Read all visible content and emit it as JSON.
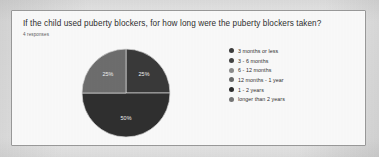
{
  "card": {
    "title": "If the child used puberty blockers, for how long were the puberty blockers taken?",
    "subtitle": "4 responses"
  },
  "chart_data": {
    "type": "pie",
    "title": "If the child used puberty blockers, for how long were the puberty blockers taken?",
    "subtitle": "4 responses",
    "legend_position": "right",
    "categories": [
      "3 months or less",
      "3 - 6 months",
      "6 - 12 months",
      "12 months - 1 year",
      "1 - 2 years",
      "longer than 2 years"
    ],
    "values": [
      25,
      25,
      50,
      0,
      0,
      0
    ],
    "value_unit": "%",
    "slices": [
      {
        "label": "3 months or less",
        "percent": "25%",
        "value": 25,
        "color": "#3a3a3a",
        "start_deg": 0,
        "end_deg": 90
      },
      {
        "label": "3 - 6 months",
        "percent": "50%",
        "value": 50,
        "color": "#303030",
        "start_deg": 90,
        "end_deg": 270
      },
      {
        "label": "6 - 12 months",
        "percent": "25%",
        "value": 25,
        "color": "#6e6e6e",
        "start_deg": 270,
        "end_deg": 360
      }
    ],
    "legend": [
      {
        "label": "3 months or less",
        "color": "#3d3d3d"
      },
      {
        "label": "3 - 6 months",
        "color": "#444444"
      },
      {
        "label": "6 - 12 months",
        "color": "#8c8c8c"
      },
      {
        "label": "12 months - 1 year",
        "color": "#6a6a6a"
      },
      {
        "label": "1 - 2 years",
        "color": "#2e2e2e"
      },
      {
        "label": "longer than 2 years",
        "color": "#767676"
      }
    ]
  }
}
